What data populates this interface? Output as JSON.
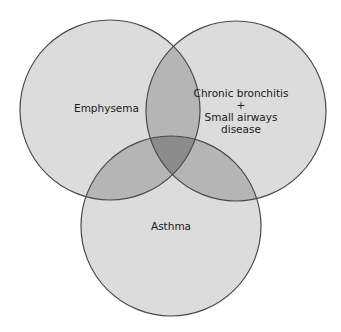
{
  "diagram": {
    "type": "venn",
    "circles": [
      {
        "id": "emphysema",
        "label_lines": [
          "Emphysema"
        ],
        "cx": 110,
        "cy": 110,
        "r": 90
      },
      {
        "id": "chronic_bronchitis",
        "label_lines": [
          "Chronic bronchitis",
          "+",
          "Small airways",
          "disease"
        ],
        "cx": 236,
        "cy": 111,
        "r": 90
      },
      {
        "id": "asthma",
        "label_lines": [
          "Asthma"
        ],
        "cx": 171,
        "cy": 226,
        "r": 90
      }
    ],
    "colors": {
      "single": "#dcdcdc",
      "double": "#b5b5b5",
      "triple": "#8c8c8c",
      "stroke": "#4a4a4a",
      "background": "#ffffff"
    }
  },
  "labels": {
    "emphysema": "Emphysema",
    "chronic_line1": "Chronic bronchitis",
    "chronic_line2": "+",
    "chronic_line3": "Small airways",
    "chronic_line4": "disease",
    "asthma": "Asthma"
  }
}
